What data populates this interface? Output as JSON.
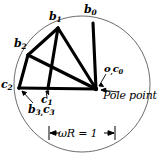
{
  "figure": {
    "type": "kinematic-diagram",
    "caption_labels": {
      "b0": {
        "base": "b",
        "sub": "0"
      },
      "b1": {
        "base": "b",
        "sub": "1"
      },
      "b2": {
        "base": "b",
        "sub": "2"
      },
      "c2": {
        "base": "c",
        "sub": "2"
      },
      "c1": {
        "base": "c",
        "sub": "1"
      },
      "b3c3_base1": "b",
      "b3c3_sub1": "3",
      "b3c3_comma": ",",
      "b3c3_base2": "c",
      "b3c3_sub2": "3",
      "o_base": "o",
      "o_comma": ",",
      "c0_base": "c",
      "c0_sub": "0"
    },
    "pole_point_label": "Pole point",
    "dimension_label": "ωR = 1",
    "colors": {
      "ink": "#000000",
      "circle_stroke": "#555555",
      "background": "#ffffff"
    },
    "geometry": {
      "circle": {
        "cx": 82,
        "cy": 84,
        "r": 68
      },
      "points": {
        "b0": {
          "x": 93,
          "y": 23
        },
        "b1": {
          "x": 58,
          "y": 28
        },
        "b2": {
          "x": 28,
          "y": 55
        },
        "c2": {
          "x": 19,
          "y": 88
        },
        "c1": {
          "x": 48,
          "y": 88
        },
        "pole": {
          "x": 96,
          "y": 89
        },
        "mid": {
          "x": 49,
          "y": 68
        }
      }
    }
  }
}
